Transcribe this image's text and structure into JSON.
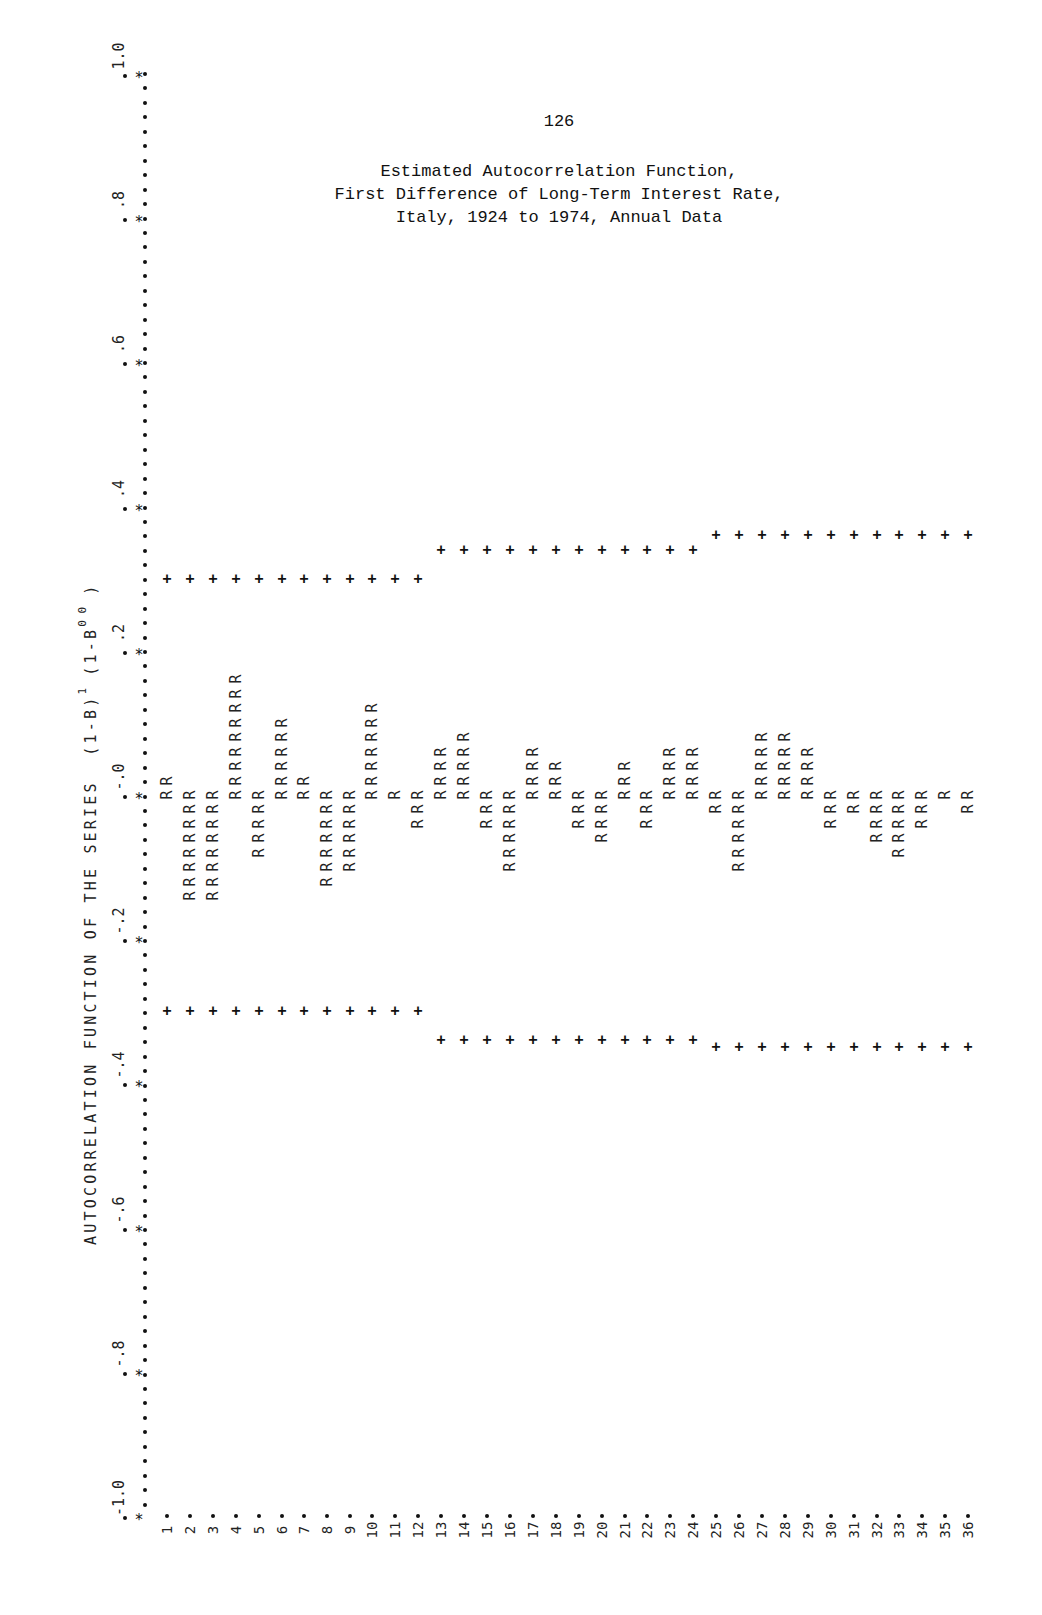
{
  "page": {
    "number": "126",
    "caption": [
      "Estimated Autocorrelation Function,",
      "First Difference of Long-Term Interest Rate,",
      "Italy, 1924 to 1974, Annual Data"
    ],
    "series_title_main": "AUTOCORRELATION FUNCTION OF THE SERIES  (1-B)",
    "series_title_exp1": "1",
    "series_title_mid": " (1-B",
    "series_title_exp2": "0 0",
    "series_title_end": " )"
  },
  "axis": {
    "value_ticks": [
      "-1.0",
      "-.8",
      "-.6",
      "-.4",
      "-.2",
      "-.0",
      ".2",
      ".4",
      ".6",
      ".8",
      "1.0"
    ],
    "value_tick_values": [
      -1.0,
      -0.8,
      -0.6,
      -0.4,
      -0.2,
      0.0,
      0.2,
      0.4,
      0.6,
      0.8,
      1.0
    ]
  },
  "chart_data": {
    "type": "bar",
    "title": "Estimated Autocorrelation Function, First Difference of Long-Term Interest Rate, Italy, 1924 to 1974, Annual Data",
    "xlabel": "Lag",
    "ylabel": "AUTOCORRELATION FUNCTION OF THE SERIES (1-B)^1 (1-B^0)^0",
    "orientation": "rotated printout: value axis vertical (1.0 top, -1.0 bottom), lags left to right",
    "ylim": [
      -1.0,
      1.0
    ],
    "grid": false,
    "legend": "none",
    "bar_glyph": "R",
    "band_glyph": "+",
    "categories": [
      "1",
      "2",
      "3",
      "4",
      "5",
      "6",
      "7",
      "8",
      "9",
      "10",
      "11",
      "12",
      "13",
      "14",
      "15",
      "16",
      "17",
      "18",
      "19",
      "20",
      "21",
      "22",
      "23",
      "24",
      "25",
      "26",
      "27",
      "28",
      "29",
      "30",
      "31",
      "32",
      "33",
      "34",
      "35",
      "36"
    ],
    "series": [
      {
        "name": "Autocorrelation",
        "values": [
          0.03,
          -0.15,
          -0.15,
          0.17,
          -0.09,
          0.11,
          0.03,
          -0.13,
          -0.11,
          0.13,
          0.01,
          -0.05,
          0.07,
          0.09,
          -0.05,
          -0.11,
          0.07,
          0.05,
          -0.05,
          -0.07,
          0.05,
          -0.05,
          0.07,
          0.07,
          -0.03,
          -0.11,
          0.09,
          0.09,
          0.07,
          -0.05,
          -0.03,
          -0.07,
          -0.09,
          -0.05,
          -0.01,
          -0.03
        ]
      },
      {
        "name": "Upper 2SE band",
        "values": [
          0.3,
          0.3,
          0.3,
          0.3,
          0.3,
          0.3,
          0.3,
          0.3,
          0.3,
          0.3,
          0.3,
          0.3,
          0.34,
          0.34,
          0.34,
          0.34,
          0.34,
          0.34,
          0.34,
          0.34,
          0.34,
          0.34,
          0.34,
          0.34,
          0.36,
          0.36,
          0.36,
          0.36,
          0.36,
          0.36,
          0.36,
          0.36,
          0.36,
          0.36,
          0.36,
          0.36
        ]
      },
      {
        "name": "Lower 2SE band",
        "values": [
          -0.3,
          -0.3,
          -0.3,
          -0.3,
          -0.3,
          -0.3,
          -0.3,
          -0.3,
          -0.3,
          -0.3,
          -0.3,
          -0.3,
          -0.34,
          -0.34,
          -0.34,
          -0.34,
          -0.34,
          -0.34,
          -0.34,
          -0.34,
          -0.34,
          -0.34,
          -0.34,
          -0.34,
          -0.35,
          -0.35,
          -0.35,
          -0.35,
          -0.35,
          -0.35,
          -0.35,
          -0.35,
          -0.35,
          -0.35,
          -0.35,
          -0.35
        ]
      }
    ],
    "r_counts": [
      2,
      -8,
      -8,
      9,
      -5,
      6,
      2,
      -7,
      -6,
      7,
      1,
      -3,
      4,
      5,
      -3,
      -6,
      4,
      3,
      -3,
      -4,
      3,
      -3,
      4,
      4,
      -2,
      -6,
      5,
      5,
      4,
      -3,
      -2,
      -4,
      -5,
      -3,
      -1,
      -2
    ]
  },
  "layout": {
    "axis_x": 145,
    "zero_y": 795,
    "px_per_unit": 721,
    "row_step": 14.45,
    "lag_x": [
      167,
      190,
      213,
      236,
      259,
      282,
      304,
      327,
      350,
      372,
      395,
      418,
      441,
      464,
      487,
      510,
      533,
      556,
      579,
      602,
      625,
      647,
      670,
      693,
      716,
      739,
      762,
      785,
      808,
      831,
      854,
      877,
      899,
      922,
      945,
      968
    ],
    "lag_label_y": 1522
  }
}
